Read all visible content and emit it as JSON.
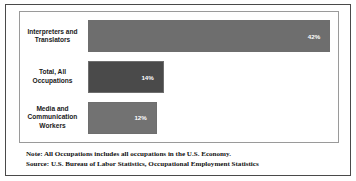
{
  "chart_data": {
    "type": "bar",
    "orientation": "horizontal",
    "title": "",
    "xlabel": "",
    "ylabel": "",
    "grid": false,
    "legend": false,
    "xlim": [
      0,
      45
    ],
    "categories": [
      "Interpreters and Translators",
      "Total, All Occupations",
      "Media and Communication Workers"
    ],
    "values": [
      42,
      14,
      12
    ],
    "value_labels": [
      "42%",
      "14%",
      "12%"
    ],
    "bar_colors": [
      "#6e6e6e",
      "#4a4a4a",
      "#727272"
    ],
    "bar_edge_color": "#6e6e6e",
    "value_label_color": "#ffffff"
  },
  "bars": [
    {
      "label_line1": "Interpreters and",
      "label_line2": "Translators",
      "label_line3": "",
      "value_label": "42%",
      "width_pct": 96.5,
      "color": "#6e6e6e"
    },
    {
      "label_line1": "Total, All",
      "label_line2": "Occupations",
      "label_line3": "",
      "value_label": "14%",
      "width_pct": 30.2,
      "color": "#4a4a4a"
    },
    {
      "label_line1": "Media and",
      "label_line2": "Communication",
      "label_line3": "Workers",
      "value_label": "12%",
      "width_pct": 27.4,
      "color": "#727272"
    }
  ],
  "footnotes": {
    "note": "Note: All Occupations includes all occupations in the U.S. Economy.",
    "source": "Source: U.S. Bureau of Labor Statistics, Occupational Employment Statistics"
  },
  "colors": {
    "outer_frame": "#4a4a4a",
    "plot_frame": "#9a9a9a",
    "background": "#ffffff",
    "label_text": "#1a1a1a",
    "footnote_text": "#111111"
  }
}
